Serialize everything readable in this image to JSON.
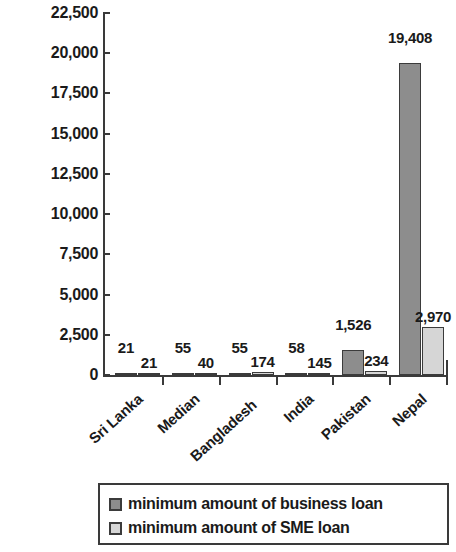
{
  "chart_data": {
    "type": "bar",
    "title": "",
    "xlabel": "",
    "ylabel": "percent GDP per capita",
    "categories": [
      "Sri Lanka",
      "Median",
      "Bangladesh",
      "India",
      "Pakistan",
      "Nepal"
    ],
    "series": [
      {
        "name": "minimum amount of business loan",
        "color": "#8d8d8d",
        "values": [
          21,
          55,
          55,
          58,
          1526,
          19408
        ],
        "labels": [
          "21",
          "55",
          "55",
          "58",
          "1,526",
          "19,408"
        ]
      },
      {
        "name": "minimum amount of SME loan",
        "color": "#d6d6d6",
        "values": [
          21,
          40,
          174,
          145,
          234,
          2970
        ],
        "labels": [
          "21",
          "40",
          "174",
          "145",
          "234",
          "2,970"
        ]
      }
    ],
    "ylim": [
      0,
      22500
    ],
    "ytick_values": [
      0,
      2500,
      5000,
      7500,
      10000,
      12500,
      15000,
      17500,
      20000,
      22500
    ],
    "ytick_labels": [
      "0",
      "2,500",
      "5,000",
      "7,500",
      "10,000",
      "12,500",
      "15,000",
      "17,500",
      "20,000",
      "22,500"
    ],
    "grid": false,
    "legend_position": "bottom"
  },
  "legend": {
    "entries": [
      {
        "label": "minimum amount of business loan"
      },
      {
        "label": "minimum amount of SME loan"
      }
    ]
  }
}
